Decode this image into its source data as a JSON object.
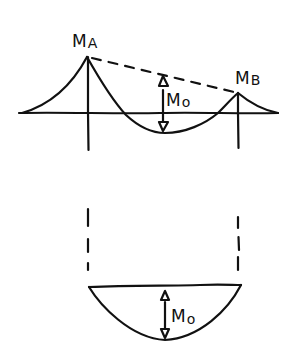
{
  "diagram": {
    "type": "bending-moment-diagram",
    "colors": {
      "ink": "#111111",
      "background": "#ffffff"
    },
    "top": {
      "labels": {
        "ma": "MA",
        "mb": "MB",
        "m0": "M0"
      },
      "ma_main": "M",
      "ma_sub": "A",
      "mb_main": "M",
      "mb_sub": "B",
      "m0_main": "M",
      "m0_sub": "o"
    },
    "bottom": {
      "m0_main": "M",
      "m0_sub": "o"
    }
  }
}
